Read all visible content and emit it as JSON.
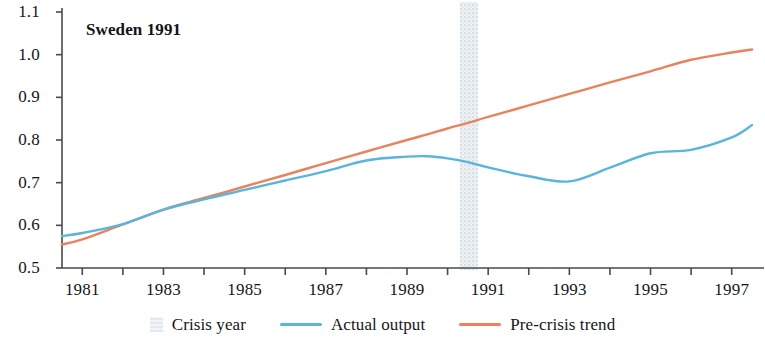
{
  "chart_data": {
    "type": "line",
    "title": "Sweden 1991",
    "xlabel": "",
    "ylabel": "",
    "xlim": [
      1980.5,
      1997.5
    ],
    "ylim": [
      0.5,
      1.1
    ],
    "yticks": [
      "0.5",
      "0.6",
      "0.7",
      "0.8",
      "0.9",
      "1.0",
      "1.1"
    ],
    "ytick_values": [
      0.5,
      0.6,
      0.7,
      0.8,
      0.9,
      1.0,
      1.1
    ],
    "xticks": [
      "1981",
      "1983",
      "1985",
      "1987",
      "1989",
      "1991",
      "1993",
      "1995",
      "1997"
    ],
    "xtick_values": [
      1981,
      1983,
      1985,
      1987,
      1989,
      1991,
      1993,
      1995,
      1997
    ],
    "grid": false,
    "legend_position": "bottom-center",
    "crisis_year": 1990.5,
    "crisis_band": [
      1990.3,
      1990.75
    ],
    "x": [
      1980.5,
      1981,
      1982,
      1983,
      1984,
      1985,
      1986,
      1987,
      1988,
      1989,
      1989.5,
      1990,
      1990.5,
      1991,
      1992,
      1993,
      1994,
      1995,
      1996,
      1997,
      1997.5
    ],
    "series": [
      {
        "name": "Actual output",
        "color": "#5ab4dc",
        "values": [
          0.575,
          0.582,
          0.603,
          0.637,
          0.661,
          0.683,
          0.705,
          0.727,
          0.752,
          0.761,
          0.762,
          0.757,
          0.748,
          0.736,
          0.715,
          0.703,
          0.735,
          0.769,
          0.777,
          0.806,
          0.835
        ]
      },
      {
        "name": "Pre-crisis trend",
        "color": "#e8835e",
        "values": [
          0.555,
          0.567,
          0.602,
          0.637,
          0.664,
          0.691,
          0.718,
          0.746,
          0.773,
          0.8,
          0.813,
          0.827,
          0.84,
          0.854,
          0.881,
          0.908,
          0.935,
          0.961,
          0.988,
          1.005,
          1.012
        ]
      }
    ],
    "legend": [
      {
        "label": "Crisis year",
        "marker": "band",
        "color": "#dde3e8"
      },
      {
        "label": "Actual output",
        "marker": "line",
        "color": "#5ab4dc"
      },
      {
        "label": "Pre-crisis trend",
        "marker": "line",
        "color": "#e8835e"
      }
    ],
    "axis_color": "#4a4a4a"
  }
}
